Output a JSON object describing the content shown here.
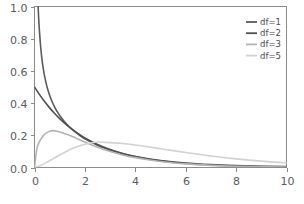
{
  "chart_data": {
    "type": "line",
    "title": "",
    "subtitle": "",
    "xlabel": "",
    "ylabel": "",
    "xlim": [
      0,
      10
    ],
    "ylim": [
      0,
      1.0
    ],
    "grid": false,
    "legend_position": "top-right",
    "x_ticks": [
      "0",
      "2",
      "4",
      "6",
      "8",
      "10"
    ],
    "x_tick_values": [
      0,
      2,
      4,
      6,
      8,
      10
    ],
    "y_ticks": [
      "0.0",
      "0.2",
      "0.4",
      "0.6",
      "0.8",
      "1.0"
    ],
    "y_tick_values": [
      0.0,
      0.2,
      0.4,
      0.6,
      0.8,
      1.0
    ],
    "series": [
      {
        "name": "df=1",
        "color": "#5a5a5a",
        "x": [
          0.02,
          0.05,
          0.08,
          0.12,
          0.16,
          0.2,
          0.25,
          0.3,
          0.35,
          0.4,
          0.5,
          0.6,
          0.7,
          0.8,
          0.9,
          1.0,
          1.2,
          1.4,
          1.6,
          1.8,
          2.0,
          2.5,
          3.0,
          3.5,
          4.0,
          4.5,
          5.0,
          6.0,
          7.0,
          8.0,
          9.0,
          10.0
        ],
        "values": [
          2.805,
          1.7418,
          1.3674,
          1.1043,
          0.9453,
          0.8394,
          0.739,
          0.6674,
          0.6123,
          0.5679,
          0.4994,
          0.4484,
          0.4082,
          0.3752,
          0.3473,
          0.323,
          0.2828,
          0.25,
          0.2225,
          0.1989,
          0.1784,
          0.1382,
          0.108,
          0.0851,
          0.0675,
          0.0539,
          0.0432,
          0.028,
          0.0184,
          0.0122,
          0.0081,
          0.0054
        ]
      },
      {
        "name": "df=2",
        "color": "#4f4f4f",
        "x": [
          0,
          0.2,
          0.4,
          0.6,
          0.8,
          1.0,
          1.25,
          1.5,
          1.75,
          2.0,
          2.5,
          3.0,
          3.5,
          4.0,
          4.5,
          5.0,
          5.5,
          6.0,
          7.0,
          8.0,
          9.0,
          10.0
        ],
        "values": [
          0.5,
          0.4524,
          0.4094,
          0.3704,
          0.3352,
          0.3033,
          0.2677,
          0.2362,
          0.2084,
          0.1839,
          0.1433,
          0.1116,
          0.0869,
          0.0677,
          0.0527,
          0.041,
          0.032,
          0.0249,
          0.0151,
          0.0092,
          0.0056,
          0.0034
        ]
      },
      {
        "name": "df=3",
        "color": "#b4b4b4",
        "x": [
          0,
          0.1,
          0.2,
          0.3,
          0.4,
          0.5,
          0.7,
          1.0,
          1.25,
          1.5,
          1.75,
          2.0,
          2.5,
          3.0,
          3.5,
          4.0,
          4.5,
          5.0,
          6.0,
          7.0,
          8.0,
          9.0,
          10.0
        ],
        "values": [
          0.0,
          0.12,
          0.1612,
          0.1876,
          0.2055,
          0.218,
          0.2288,
          0.2207,
          0.208,
          0.1921,
          0.1751,
          0.1579,
          0.126,
          0.0996,
          0.0781,
          0.0611,
          0.0477,
          0.0372,
          0.0224,
          0.0135,
          0.008,
          0.0047,
          0.0028
        ]
      },
      {
        "name": "df=5",
        "color": "#d2d2d2",
        "x": [
          0,
          0.25,
          0.5,
          0.75,
          1.0,
          1.5,
          2.0,
          2.5,
          3.0,
          3.5,
          4.0,
          4.5,
          5.0,
          5.5,
          6.0,
          6.5,
          7.0,
          7.5,
          8.0,
          8.5,
          9.0,
          9.5,
          10.0
        ],
        "values": [
          0.0,
          0.0131,
          0.0334,
          0.0554,
          0.0776,
          0.1179,
          0.1439,
          0.1582,
          0.1542,
          0.1494,
          0.1398,
          0.1286,
          0.1166,
          0.1046,
          0.0929,
          0.0818,
          0.0715,
          0.0621,
          0.0536,
          0.046,
          0.0393,
          0.0335,
          0.0285
        ]
      }
    ],
    "legend": [
      {
        "label": "df=1",
        "color": "#5a5a5a"
      },
      {
        "label": "df=2",
        "color": "#4f4f4f"
      },
      {
        "label": "df=3",
        "color": "#b4b4b4"
      },
      {
        "label": "df=5",
        "color": "#d2d2d2"
      }
    ]
  },
  "axes": {
    "frame_color": "#8c8c8c",
    "background": "#ffffff"
  }
}
